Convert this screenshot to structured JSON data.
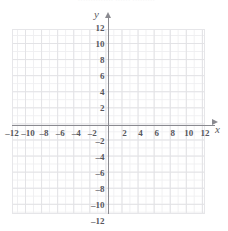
{
  "header": {
    "fragment_text": "·············· ······ ·········"
  },
  "axis_labels": {
    "x_name": "x",
    "y_name": "y"
  },
  "chart_data": {
    "type": "scatter",
    "title": "",
    "subtitle": "",
    "xlabel": "x",
    "ylabel": "y",
    "xlim": [
      -12,
      12
    ],
    "ylim": [
      -12,
      12
    ],
    "grid": true,
    "grid_minor_step": 1,
    "grid_major_step": 2,
    "legend": null,
    "legend_position": "none",
    "annotations": [],
    "series": [],
    "x_ticks": [
      -12,
      -10,
      -8,
      -6,
      -4,
      -2,
      2,
      4,
      6,
      8,
      10,
      12
    ],
    "y_ticks": [
      12,
      10,
      8,
      6,
      4,
      2,
      -2,
      -4,
      -6,
      -8,
      -10,
      -12
    ],
    "x_tick_labels": [
      "–12",
      "–10",
      "–8",
      "–6",
      "–4",
      "–2",
      "2",
      "4",
      "6",
      "8",
      "10",
      "12"
    ],
    "y_tick_labels": [
      "12",
      "10",
      "8",
      "6",
      "4",
      "2",
      "–2",
      "–4",
      "–6",
      "–8",
      "–10",
      "–12"
    ],
    "axis_arrows": {
      "x_positive": true,
      "y_positive": true
    },
    "colors": {
      "axis": "#8a8a90",
      "grid_minor": "#efeff1",
      "grid_major": "#e2e2e5",
      "label": "#57575d",
      "background": "#ffffff"
    }
  }
}
